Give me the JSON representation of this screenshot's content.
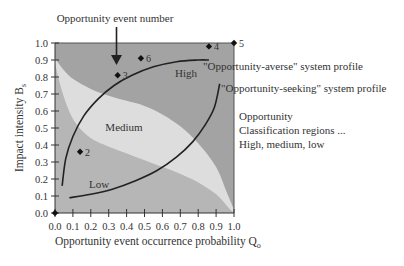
{
  "chart_data": {
    "type": "scatter",
    "title": "",
    "xlabel": "Opportunity event occurrence probability Q",
    "xlabel_sub": "o",
    "ylabel": "Impact intensity B",
    "ylabel_sub": "s",
    "xlim": [
      0.0,
      1.0
    ],
    "ylim": [
      0.0,
      1.0
    ],
    "x_ticks": [
      "0.0",
      "0.1",
      "0.2",
      "0.3",
      "0.4",
      "0.5",
      "0.6",
      "0.7",
      "0.8",
      "0.9",
      "1.0"
    ],
    "y_ticks": [
      "0.0",
      "0.1",
      "0.2",
      "0.3",
      "0.4",
      "0.5",
      "0.6",
      "0.7",
      "0.8",
      "0.9",
      "1.0"
    ],
    "grid": false,
    "points": [
      {
        "label": "1",
        "x": 0.0,
        "y": 0.0
      },
      {
        "label": "2",
        "x": 0.14,
        "y": 0.36
      },
      {
        "label": "3",
        "x": 0.35,
        "y": 0.81
      },
      {
        "label": "4",
        "x": 0.86,
        "y": 0.98
      },
      {
        "label": "5",
        "x": 1.0,
        "y": 1.0
      },
      {
        "label": "6",
        "x": 0.48,
        "y": 0.91
      }
    ],
    "point_labels_shown": [
      "",
      "2",
      "3",
      "4",
      "5",
      "6"
    ],
    "regions": [
      {
        "name": "High",
        "color": "#a3a3a3"
      },
      {
        "name": "Medium",
        "color": "#dddddd"
      },
      {
        "name": "Low",
        "color": "#b6b6b6"
      }
    ],
    "region_label_positions": {
      "High": {
        "x": 0.74,
        "y": 0.82
      },
      "Medium": {
        "x": 0.38,
        "y": 0.5
      },
      "Low": {
        "x": 0.24,
        "y": 0.17
      }
    },
    "medium_upper_boundary": [
      [
        0.0,
        0.91
      ],
      [
        0.05,
        0.84
      ],
      [
        0.1,
        0.79
      ],
      [
        0.2,
        0.73
      ],
      [
        0.3,
        0.69
      ],
      [
        0.4,
        0.66
      ],
      [
        0.5,
        0.63
      ],
      [
        0.6,
        0.58
      ],
      [
        0.7,
        0.51
      ],
      [
        0.8,
        0.41
      ],
      [
        0.9,
        0.27
      ],
      [
        0.96,
        0.12
      ],
      [
        1.0,
        0.02
      ]
    ],
    "medium_lower_boundary": [
      [
        0.0,
        0.88
      ],
      [
        0.03,
        0.75
      ],
      [
        0.07,
        0.62
      ],
      [
        0.12,
        0.52
      ],
      [
        0.2,
        0.44
      ],
      [
        0.3,
        0.39
      ],
      [
        0.4,
        0.35
      ],
      [
        0.5,
        0.31
      ],
      [
        0.6,
        0.27
      ],
      [
        0.7,
        0.23
      ],
      [
        0.8,
        0.18
      ],
      [
        0.9,
        0.11
      ],
      [
        0.97,
        0.03
      ],
      [
        1.0,
        0.0
      ]
    ],
    "series": [
      {
        "name": "\"Opportunity-averse\" system profile",
        "type": "line",
        "points": [
          [
            0.04,
            0.16
          ],
          [
            0.06,
            0.32
          ],
          [
            0.1,
            0.45
          ],
          [
            0.16,
            0.57
          ],
          [
            0.24,
            0.67
          ],
          [
            0.33,
            0.75
          ],
          [
            0.43,
            0.81
          ],
          [
            0.55,
            0.86
          ],
          [
            0.68,
            0.89
          ],
          [
            0.8,
            0.9
          ],
          [
            0.86,
            0.9
          ]
        ]
      },
      {
        "name": "\"Opportunity-seeking\" system profile",
        "type": "line",
        "points": [
          [
            0.08,
            0.09
          ],
          [
            0.2,
            0.11
          ],
          [
            0.32,
            0.14
          ],
          [
            0.45,
            0.19
          ],
          [
            0.57,
            0.25
          ],
          [
            0.68,
            0.33
          ],
          [
            0.77,
            0.42
          ],
          [
            0.84,
            0.52
          ],
          [
            0.89,
            0.62
          ],
          [
            0.92,
            0.76
          ]
        ]
      }
    ],
    "annotations": [
      {
        "text": "Opportunity event number",
        "arrow_to": "event 3"
      },
      {
        "text": "\"Opportunity-averse\" system profile"
      },
      {
        "text": "\"Opportunity-seeking\" system profile"
      },
      {
        "text": "Opportunity"
      },
      {
        "text": "Classification regions ..."
      },
      {
        "text": "High, medium, low"
      }
    ],
    "legend_position": "right"
  }
}
